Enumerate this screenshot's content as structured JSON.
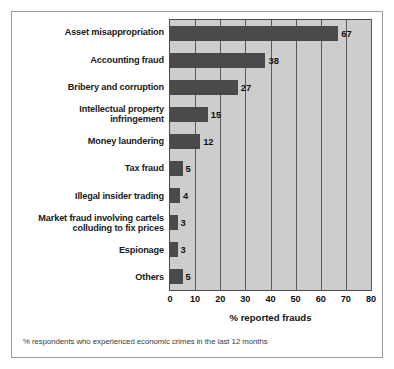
{
  "chart_data": {
    "type": "bar",
    "orientation": "horizontal",
    "title": "",
    "xlabel": "% reported frauds",
    "ylabel": "",
    "xlim": [
      0,
      80
    ],
    "xticks": [
      0,
      10,
      20,
      30,
      40,
      50,
      60,
      70,
      80
    ],
    "grid": true,
    "legend": false,
    "categories": [
      "Asset misappropriation",
      "Accounting fraud",
      "Bribery and corruption",
      "Intellectual property infringement",
      "Money laundering",
      "Tax fraud",
      "Illegal insider trading",
      "Market fraud involving cartels colluding to fix prices",
      "Espionage",
      "Others"
    ],
    "values": [
      67,
      38,
      27,
      15,
      12,
      5,
      4,
      3,
      3,
      5
    ],
    "data_labels": [
      "67",
      "38",
      "27",
      "15",
      "12",
      "5",
      "4",
      "3",
      "3",
      "5"
    ],
    "footnote": "% respondents who experienced economic crimes in the last 12 months",
    "colors": {
      "bar": "#4a4a4a",
      "plot_background": "#cdcdcd",
      "gridline": "#5a5a5a",
      "axis": "#4d4d4d",
      "figure_border": "#9a9a9a",
      "text": "#111111"
    }
  },
  "category_display": [
    "Asset misappropriation",
    "Accounting fraud",
    "Bribery and corruption",
    "Intellectual property\ninfringement",
    "Money laundering",
    "Tax fraud",
    "Illegal insider trading",
    "Market fraud involving cartels\ncolluding to fix prices",
    "Espionage",
    "Others"
  ]
}
